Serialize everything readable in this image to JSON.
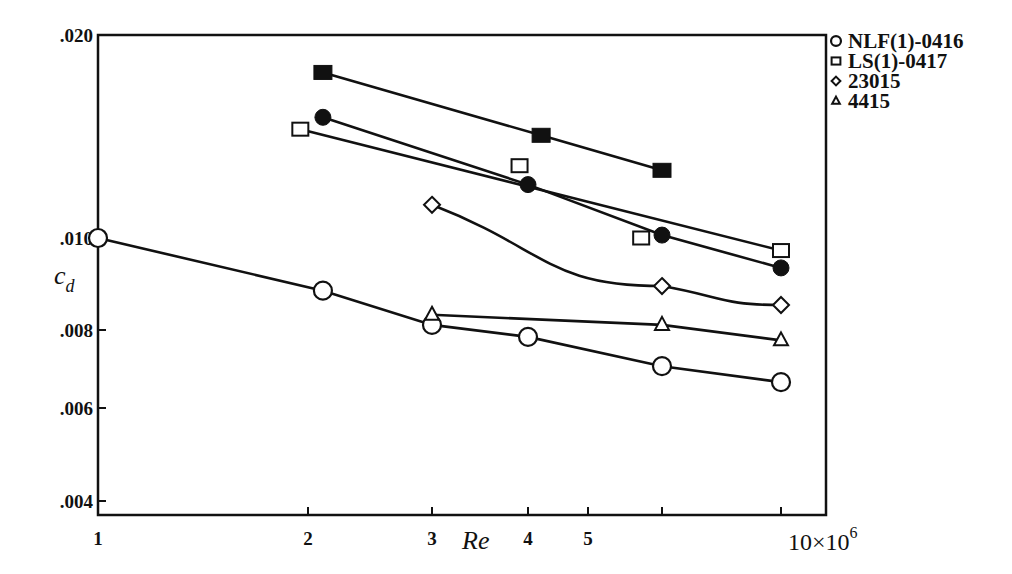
{
  "chart_data": {
    "type": "line",
    "title": "",
    "xlabel": "Re",
    "ylabel": "c_d",
    "x_scale": "log",
    "y_scale": "log",
    "xlim": [
      1,
      10
    ],
    "ylim": [
      0.0037,
      0.02
    ],
    "x_multiplier_label": "10×10",
    "x_multiplier_exponent": "6",
    "x_ticks": [
      {
        "value": 1,
        "label": "1",
        "px": 98
      },
      {
        "value": 2,
        "label": "2",
        "px": 308
      },
      {
        "value": 3,
        "label": "3",
        "px": 432
      },
      {
        "value": 4,
        "label": "4",
        "px": 528
      },
      {
        "value": 5,
        "label": "5",
        "px": 588
      },
      {
        "value": 6,
        "label": "",
        "px": 662
      },
      {
        "value": 10,
        "label": "",
        "px": 781
      }
    ],
    "y_ticks": [
      {
        "value": 0.02,
        "label": ".020",
        "px": 35
      },
      {
        "value": 0.01,
        "label": ".010",
        "px": 238
      },
      {
        "value": 0.008,
        "label": ".008",
        "px": 330
      },
      {
        "value": 0.006,
        "label": ".006",
        "px": 408
      },
      {
        "value": 0.004,
        "label": ".004",
        "px": 501
      }
    ],
    "grid": false,
    "legend_position": "right-top",
    "legend": [
      {
        "label": "NLF(1)-0416",
        "marker": "circle-open"
      },
      {
        "label": "LS(1)-0417",
        "marker": "square-open"
      },
      {
        "label": "23015",
        "marker": "diamond-open"
      },
      {
        "label": "4415",
        "marker": "triangle-open"
      }
    ],
    "series": [
      {
        "name": "NLF(1)-0416",
        "marker": "circle-open",
        "smooth": false,
        "x": [
          1.0,
          2.1,
          3.0,
          4.0,
          6.0,
          10.0
        ],
        "y": [
          0.01,
          0.0088,
          0.0081,
          0.0078,
          0.007,
          0.0066
        ]
      },
      {
        "name": "LS(1)-0417",
        "marker": "square-open",
        "smooth": false,
        "x": [
          1.95,
          3.9,
          5.7,
          10.0
        ],
        "y": [
          0.0145,
          0.0128,
          0.01,
          0.0097
        ],
        "line_through": [
          0,
          3
        ]
      },
      {
        "name": "LS(1)-0417 (filled square)",
        "marker": "square-filled",
        "smooth": false,
        "x": [
          2.1,
          4.2,
          6.0
        ],
        "y": [
          0.0176,
          0.0142,
          0.0126
        ]
      },
      {
        "name": "NLF(1)-0416 (filled circle)",
        "marker": "circle-filled",
        "smooth": false,
        "x": [
          2.1,
          4.0,
          6.0,
          10.0
        ],
        "y": [
          0.0151,
          0.012,
          0.0101,
          0.0093
        ]
      },
      {
        "name": "23015",
        "marker": "diamond-open",
        "smooth": true,
        "x": [
          3.0,
          6.0,
          10.0
        ],
        "y": [
          0.0112,
          0.0089,
          0.0085
        ]
      },
      {
        "name": "4415",
        "marker": "triangle-open",
        "smooth": false,
        "x": [
          3.0,
          6.0,
          10.0
        ],
        "y": [
          0.0083,
          0.0081,
          0.0077
        ]
      }
    ]
  }
}
